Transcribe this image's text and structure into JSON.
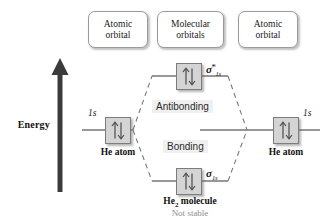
{
  "diagram": {
    "axis": {
      "label": "Energy",
      "direction": "up",
      "arrow_icon": "up-arrow-icon"
    },
    "captions": {
      "left": {
        "line1": "Atomic",
        "line2": "orbital"
      },
      "middle": {
        "line1": "Molecular",
        "line2": "orbitals"
      },
      "right": {
        "line1": "Atomic",
        "line2": "orbital"
      }
    },
    "atoms": {
      "left": {
        "orbital_label": "1s",
        "name": "He atom",
        "electrons": "paired"
      },
      "right": {
        "orbital_label": "1s",
        "name": "He atom",
        "electrons": "paired"
      }
    },
    "molecular_orbitals": [
      {
        "id": "antibonding",
        "sigma": "σ",
        "star": "*",
        "subscript": "1s",
        "region_label": "Antibonding",
        "electrons": "paired"
      },
      {
        "id": "bonding",
        "sigma": "σ",
        "star": "",
        "subscript": "1s",
        "region_label": "Bonding",
        "electrons": "paired"
      }
    ],
    "molecule": {
      "name_prefix": "He",
      "name_sub": "2",
      "name_suffix": " molecule",
      "stability": "Not stable"
    },
    "colors": {
      "line": "#767676",
      "orbital_fill": "#d4d4d4",
      "orbital_border": "#7c7c7c",
      "arrow": "#3b3b3b",
      "caption_border": "#9a9a9a",
      "region_bg": "#f0f0f0",
      "not_stable_text": "#8e8e8e",
      "background": "#ffffff"
    }
  }
}
